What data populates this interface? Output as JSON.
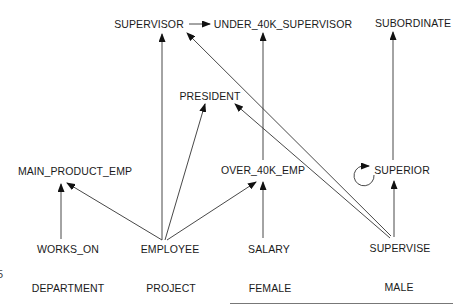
{
  "diagram": {
    "type": "hierarchy",
    "nodes": [
      {
        "id": "SUPERVISOR",
        "label": "SUPERVISOR",
        "x": 149,
        "y": 24
      },
      {
        "id": "UNDER_40K_SUPERVISOR",
        "label": "UNDER_40K_SUPERVISOR",
        "x": 283,
        "y": 24
      },
      {
        "id": "SUBORDINATE",
        "label": "SUBORDINATE",
        "x": 413,
        "y": 23
      },
      {
        "id": "PRESIDENT",
        "label": "PRESIDENT",
        "x": 210,
        "y": 96
      },
      {
        "id": "MAIN_PRODUCT_EMP",
        "label": "MAIN_PRODUCT_EMP",
        "x": 75,
        "y": 171
      },
      {
        "id": "OVER_40K_EMP",
        "label": "OVER_40K_EMP",
        "x": 263,
        "y": 170
      },
      {
        "id": "SUPERIOR",
        "label": "SUPERIOR",
        "x": 402,
        "y": 170
      },
      {
        "id": "WORKS_ON",
        "label": "WORKS_ON",
        "x": 68,
        "y": 249
      },
      {
        "id": "EMPLOYEE",
        "label": "EMPLOYEE",
        "x": 170,
        "y": 249
      },
      {
        "id": "SALARY",
        "label": "SALARY",
        "x": 269,
        "y": 249
      },
      {
        "id": "SUPERVISE",
        "label": "SUPERVISE",
        "x": 400,
        "y": 248
      },
      {
        "id": "DEPARTMENT",
        "label": "DEPARTMENT",
        "x": 68,
        "y": 288
      },
      {
        "id": "PROJECT",
        "label": "PROJECT",
        "x": 171,
        "y": 288
      },
      {
        "id": "FEMALE",
        "label": "FEMALE",
        "x": 270,
        "y": 288
      },
      {
        "id": "MALE",
        "label": "MALE",
        "x": 399,
        "y": 287
      }
    ],
    "edges": [
      {
        "from": "SUPERVISOR",
        "to": "UNDER_40K_SUPERVISOR"
      },
      {
        "from": "EMPLOYEE",
        "to": "SUPERVISOR"
      },
      {
        "from": "EMPLOYEE",
        "to": "PRESIDENT"
      },
      {
        "from": "EMPLOYEE",
        "to": "MAIN_PRODUCT_EMP"
      },
      {
        "from": "EMPLOYEE",
        "to": "OVER_40K_EMP"
      },
      {
        "from": "WORKS_ON",
        "to": "MAIN_PRODUCT_EMP"
      },
      {
        "from": "SALARY",
        "to": "OVER_40K_EMP"
      },
      {
        "from": "OVER_40K_EMP",
        "to": "UNDER_40K_SUPERVISOR"
      },
      {
        "from": "SUPERVISE",
        "to": "SUPERVISOR"
      },
      {
        "from": "SUPERVISE",
        "to": "PRESIDENT"
      },
      {
        "from": "SUPERVISE",
        "to": "SUPERIOR"
      },
      {
        "from": "SUPERIOR",
        "to": "SUBORDINATE"
      },
      {
        "from": "SUPERIOR",
        "to": "SUPERIOR",
        "self_loop": true
      }
    ]
  },
  "stray_text": "5"
}
